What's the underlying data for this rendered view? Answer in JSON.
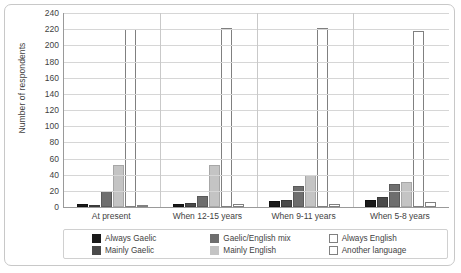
{
  "chart_data": {
    "type": "bar",
    "title": "",
    "xlabel": "",
    "ylabel": "Number of respondents",
    "ylim": [
      0,
      240
    ],
    "ytick_step": 20,
    "yticks": [
      240,
      220,
      200,
      180,
      160,
      140,
      120,
      100,
      80,
      60,
      40,
      20,
      0
    ],
    "grid": true,
    "legend_position": "bottom",
    "categories": [
      "At present",
      "When 12-15 years",
      "When 9-11 years",
      "When 5-8 years"
    ],
    "series": [
      {
        "name": "Always Gaelic",
        "color": "#1a1a1a",
        "values": [
          4,
          4,
          7,
          9
        ]
      },
      {
        "name": "Mainly Gaelic",
        "color": "#4a4a4a",
        "values": [
          2,
          5,
          9,
          13
        ]
      },
      {
        "name": "Gaelic/English mix",
        "color": "#6e6e6e",
        "values": [
          20,
          14,
          26,
          28
        ]
      },
      {
        "name": "Mainly English",
        "color": "#c4c4c4",
        "values": [
          52,
          52,
          40,
          31
        ]
      },
      {
        "name": "Always English",
        "color": "#ffffff",
        "values": [
          220,
          222,
          222,
          218
        ]
      },
      {
        "name": "Another language",
        "color": "#ffffff",
        "values": [
          3,
          4,
          4,
          6
        ]
      }
    ]
  }
}
